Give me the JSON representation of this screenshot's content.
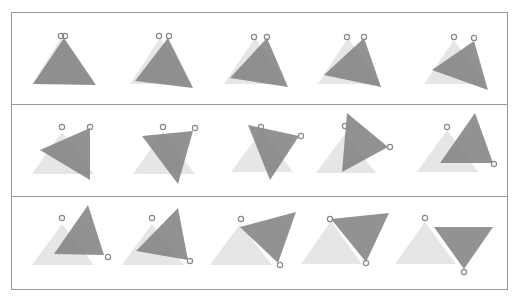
{
  "diagram": {
    "frame_rows": [
      {
        "y_top": 12,
        "y_bottom": 104
      },
      {
        "y_top": 104,
        "y_bottom": 196
      },
      {
        "y_top": 196,
        "y_bottom": 289
      }
    ],
    "frame_x": [
      11,
      507
    ],
    "colors": {
      "reference_triangle": "#e6e6e6",
      "moving_triangle": "#7f7f7f",
      "pivot_marker": "#8a8a8a",
      "border": "#9a9a9a"
    },
    "frames": [
      {
        "ghost": [
          [
            61,
            38
          ],
          [
            32,
            84
          ],
          [
            94,
            84
          ]
        ],
        "tri": [
          [
            64,
            38
          ],
          [
            33,
            84
          ],
          [
            96,
            85
          ]
        ],
        "pivots": [
          [
            61,
            36
          ],
          [
            65,
            36
          ]
        ]
      },
      {
        "ghost": [
          [
            160,
            38
          ],
          [
            130,
            84
          ],
          [
            191,
            84
          ]
        ],
        "tri": [
          [
            168,
            38
          ],
          [
            135,
            81
          ],
          [
            193,
            88
          ]
        ],
        "pivots": [
          [
            159,
            36
          ],
          [
            169,
            36
          ]
        ]
      },
      {
        "ghost": [
          [
            255,
            38
          ],
          [
            224,
            84
          ],
          [
            286,
            84
          ]
        ],
        "tri": [
          [
            267,
            38
          ],
          [
            230,
            78
          ],
          [
            288,
            87
          ]
        ],
        "pivots": [
          [
            254,
            37
          ],
          [
            267,
            37
          ]
        ]
      },
      {
        "ghost": [
          [
            348,
            38
          ],
          [
            318,
            84
          ],
          [
            380,
            84
          ]
        ],
        "tri": [
          [
            364,
            38
          ],
          [
            324,
            75
          ],
          [
            381,
            87
          ]
        ],
        "pivots": [
          [
            347,
            37
          ],
          [
            364,
            37
          ]
        ]
      },
      {
        "ghost": [
          [
            454,
            40
          ],
          [
            424,
            84
          ],
          [
            486,
            84
          ]
        ],
        "tri": [
          [
            474,
            41
          ],
          [
            432,
            70
          ],
          [
            488,
            90
          ]
        ],
        "pivots": [
          [
            454,
            37
          ],
          [
            474,
            38
          ]
        ]
      },
      {
        "ghost": [
          [
            62,
            132
          ],
          [
            32,
            174
          ],
          [
            94,
            174
          ]
        ],
        "tri": [
          [
            90,
            128
          ],
          [
            40,
            150
          ],
          [
            90,
            180
          ]
        ],
        "pivots": [
          [
            62,
            127
          ],
          [
            90,
            127
          ]
        ]
      },
      {
        "ghost": [
          [
            163,
            132
          ],
          [
            133,
            174
          ],
          [
            195,
            174
          ]
        ],
        "tri": [
          [
            193,
            131
          ],
          [
            142,
            136
          ],
          [
            178,
            184
          ]
        ],
        "pivots": [
          [
            163,
            127
          ],
          [
            195,
            128
          ]
        ]
      },
      {
        "ghost": [
          [
            262,
            130
          ],
          [
            231,
            172
          ],
          [
            293,
            172
          ]
        ],
        "tri": [
          [
            248,
            125
          ],
          [
            299,
            136
          ],
          [
            270,
            180
          ]
        ],
        "pivots": [
          [
            261,
            127
          ],
          [
            301,
            136
          ]
        ]
      },
      {
        "ghost": [
          [
            345,
            134
          ],
          [
            316,
            173
          ],
          [
            376,
            173
          ]
        ],
        "tri": [
          [
            347,
            113
          ],
          [
            388,
            147
          ],
          [
            342,
            172
          ]
        ],
        "pivots": [
          [
            345,
            126
          ],
          [
            390,
            147
          ]
        ]
      },
      {
        "ghost": [
          [
            447,
            130
          ],
          [
            417,
            172
          ],
          [
            478,
            172
          ]
        ],
        "tri": [
          [
            475,
            113
          ],
          [
            493,
            163
          ],
          [
            440,
            163
          ]
        ],
        "pivots": [
          [
            447,
            127
          ],
          [
            494,
            164
          ]
        ]
      },
      {
        "ghost": [
          [
            62,
            224
          ],
          [
            32,
            265
          ],
          [
            94,
            265
          ]
        ],
        "tri": [
          [
            88,
            205
          ],
          [
            104,
            255
          ],
          [
            54,
            254
          ]
        ],
        "pivots": [
          [
            62,
            218
          ],
          [
            108,
            257
          ]
        ]
      },
      {
        "ghost": [
          [
            152,
            224
          ],
          [
            122,
            265
          ],
          [
            184,
            265
          ]
        ],
        "tri": [
          [
            178,
            208
          ],
          [
            188,
            260
          ],
          [
            136,
            251
          ]
        ],
        "pivots": [
          [
            152,
            218
          ],
          [
            190,
            261
          ]
        ]
      },
      {
        "ghost": [
          [
            240,
            224
          ],
          [
            210,
            265
          ],
          [
            272,
            265
          ]
        ],
        "tri": [
          [
            240,
            227
          ],
          [
            296,
            212
          ],
          [
            278,
            263
          ]
        ],
        "pivots": [
          [
            241,
            219
          ],
          [
            280,
            265
          ]
        ]
      },
      {
        "ghost": [
          [
            331,
            221
          ],
          [
            301,
            264
          ],
          [
            362,
            264
          ]
        ],
        "tri": [
          [
            331,
            219
          ],
          [
            389,
            213
          ],
          [
            366,
            262
          ]
        ],
        "pivots": [
          [
            330,
            219
          ],
          [
            366,
            263
          ]
        ]
      },
      {
        "ghost": [
          [
            425,
            222
          ],
          [
            395,
            264
          ],
          [
            456,
            264
          ]
        ],
        "tri": [
          [
            434,
            227
          ],
          [
            493,
            227
          ],
          [
            464,
            269
          ]
        ],
        "pivots": [
          [
            425,
            218
          ],
          [
            464,
            272
          ]
        ]
      }
    ]
  }
}
